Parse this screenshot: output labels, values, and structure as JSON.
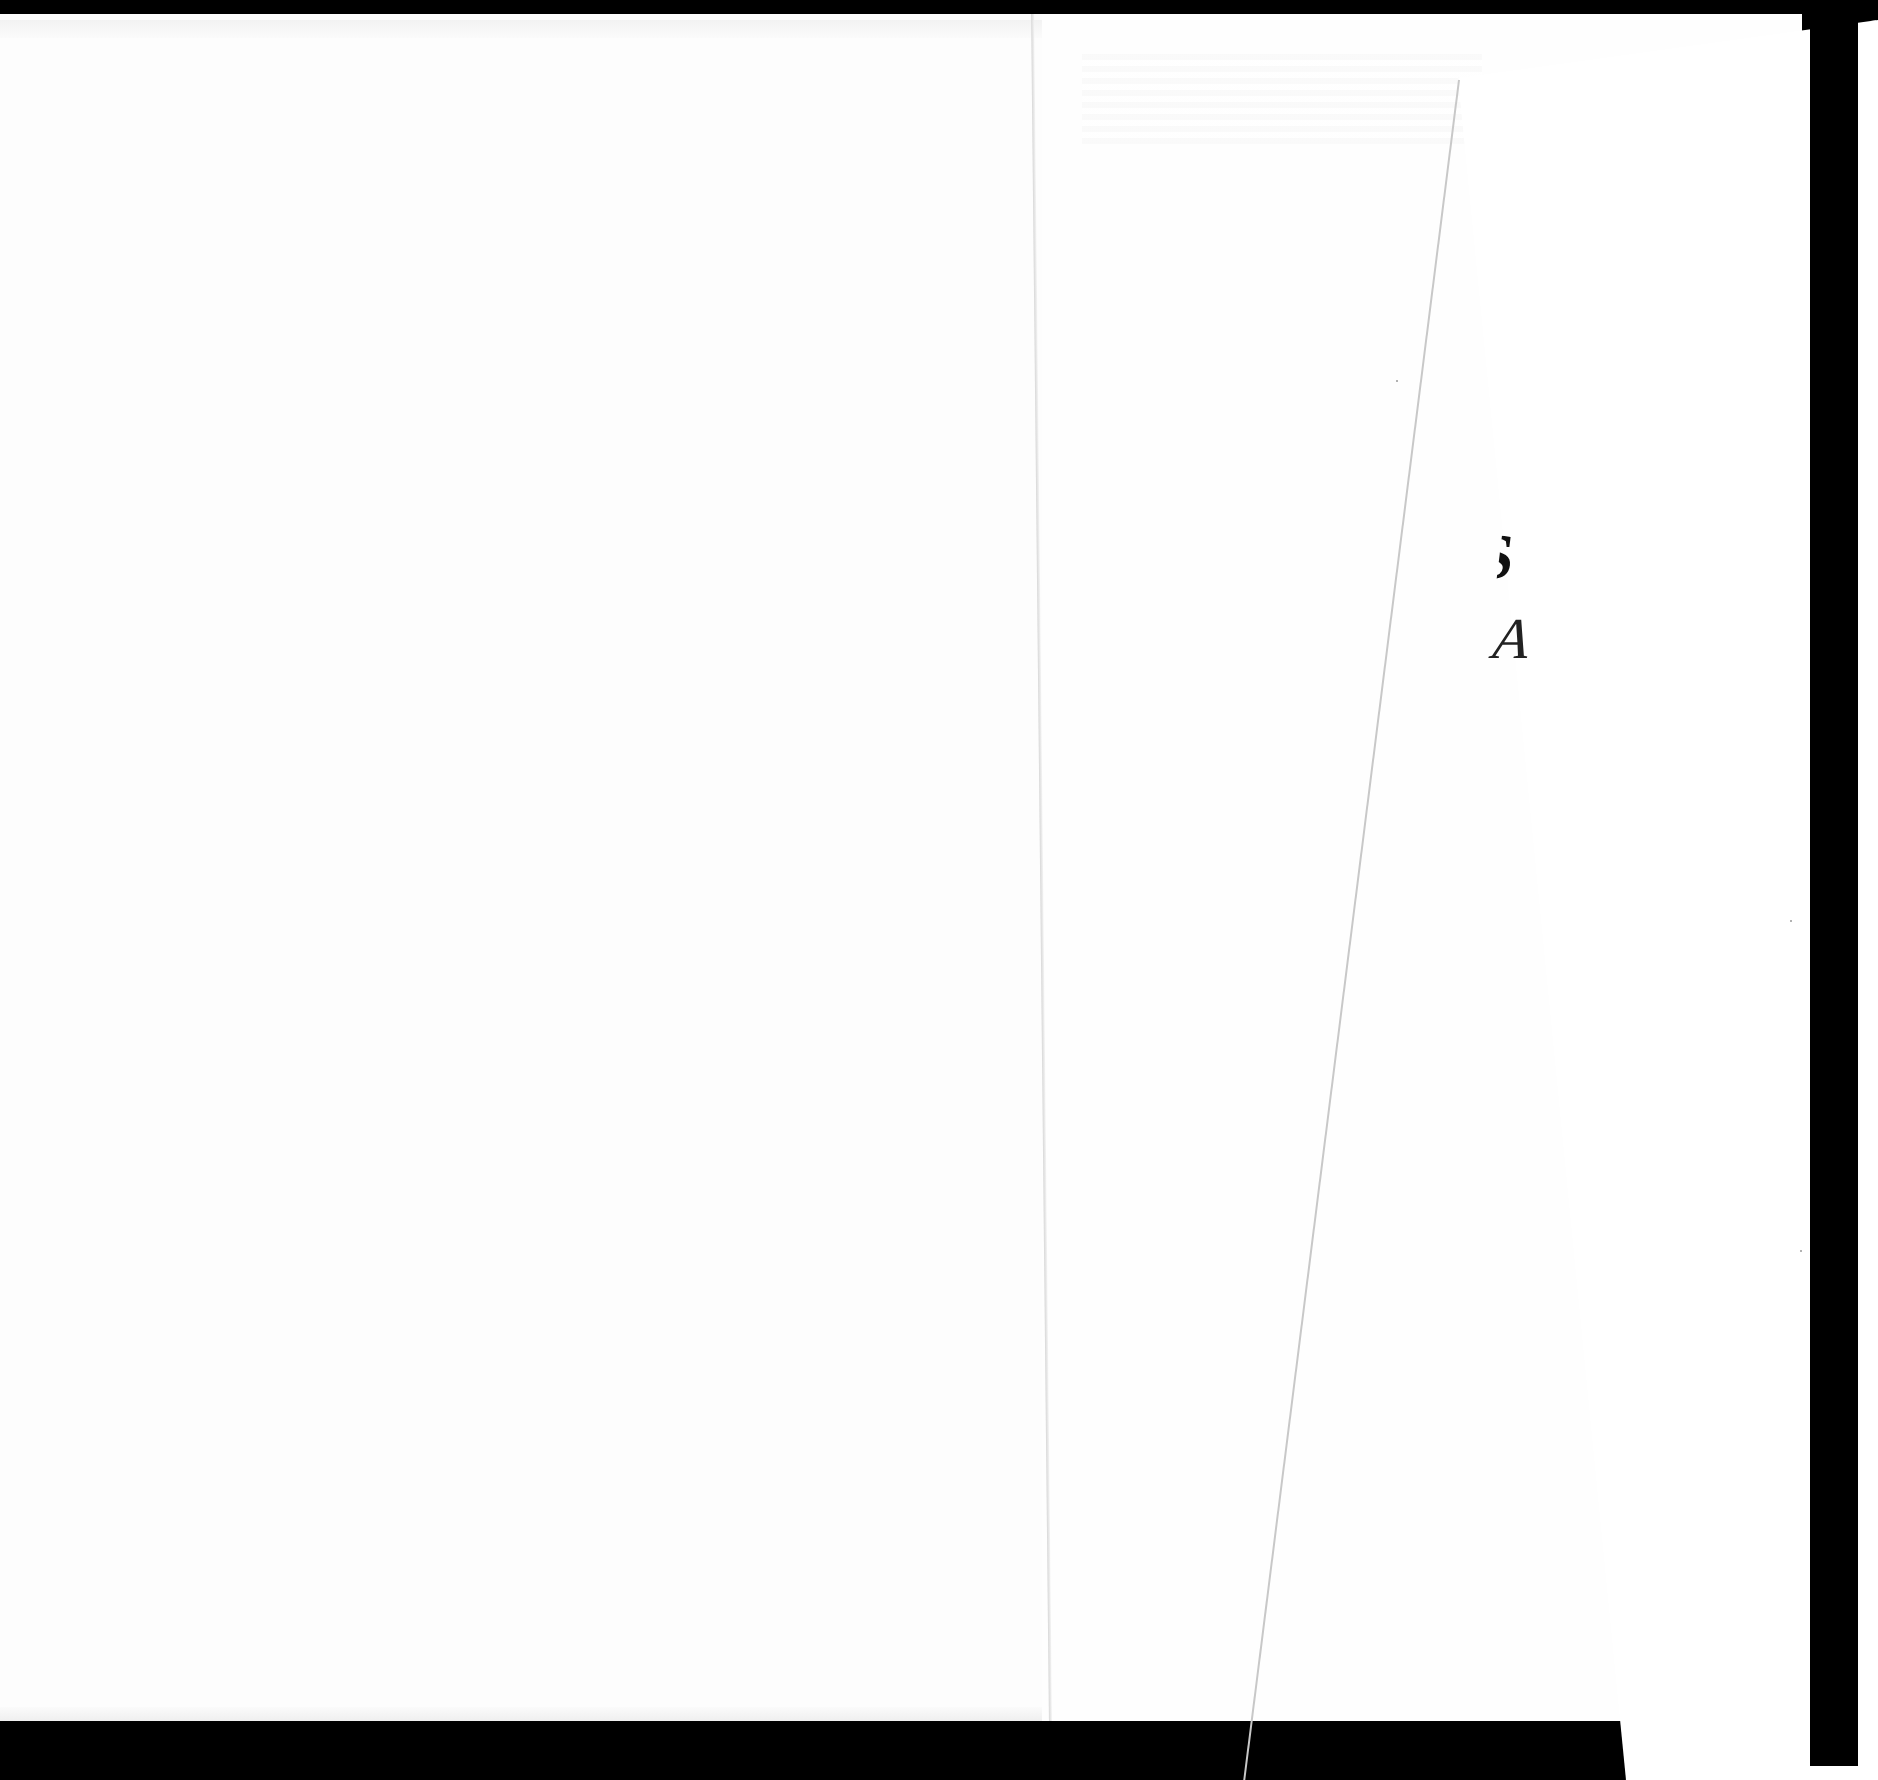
{
  "document": {
    "type": "scanned-book-spread",
    "pages": [
      {
        "id": "left-page",
        "content": ""
      },
      {
        "id": "right-page",
        "content": ""
      },
      {
        "id": "overlay-page",
        "visible_fragments": {
          "title_fragment": "S",
          "subtitle_fragment": "A"
        }
      }
    ]
  },
  "colors": {
    "background": "#000000",
    "paper": "#ffffff",
    "ink": "#111111"
  }
}
